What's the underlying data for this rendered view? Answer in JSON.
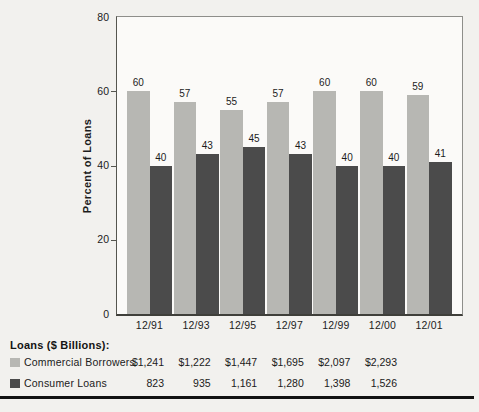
{
  "colors": {
    "commercial": "#b7b7b3",
    "consumer": "#4b4b4b",
    "page_bg": "#f2f1ee",
    "plot_bg": "#fbfaf8",
    "frame": "#8e8e8a",
    "rule": "#121212"
  },
  "chart_data": {
    "type": "bar",
    "title": "",
    "ylabel": "Percent of Loans",
    "xlabel": "",
    "ylim": [
      0,
      80
    ],
    "yticks": [
      0,
      20,
      40,
      60,
      80
    ],
    "grid": "off",
    "legend_position": "bottom-left",
    "bar_value_labels_shown": true,
    "categories": [
      "12/91",
      "12/93",
      "12/95",
      "12/97",
      "12/99",
      "12/00",
      "12/01"
    ],
    "series": [
      {
        "name": "Commercial Borrowers",
        "color_key": "commercial",
        "values": [
          60,
          57,
          55,
          57,
          60,
          60,
          59
        ]
      },
      {
        "name": "Consumer Loans",
        "color_key": "consumer",
        "values": [
          40,
          43,
          45,
          43,
          40,
          40,
          41
        ]
      }
    ]
  },
  "table": {
    "heading": "Loans ($ Billions):",
    "rows": [
      {
        "label": "Commercial Borrowers",
        "color_key": "commercial",
        "values": [
          "$1,241",
          "$1,222",
          "$1,447",
          "$1,695",
          "$2,097",
          "$2,293"
        ]
      },
      {
        "label": "Consumer Loans",
        "color_key": "consumer",
        "values": [
          "823",
          "935",
          "1,161",
          "1,280",
          "1,398",
          "1,526"
        ]
      }
    ]
  }
}
